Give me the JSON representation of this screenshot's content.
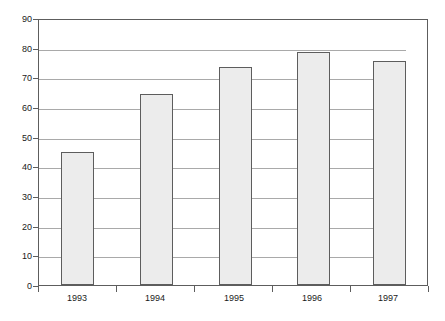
{
  "chart_data": {
    "type": "bar",
    "title": "",
    "subtitle": "",
    "xlabel": "",
    "ylabel": "",
    "categories": [
      "1993",
      "1994",
      "1995",
      "1996",
      "1997"
    ],
    "values": [
      45,
      65,
      74,
      79,
      76
    ],
    "series": [
      {
        "name": "",
        "values": [
          45,
          65,
          74,
          79,
          76
        ]
      }
    ],
    "ylim": [
      0,
      90
    ],
    "ytick_labels": [
      "0",
      "10",
      "20",
      "30",
      "40",
      "50",
      "60",
      "70",
      "80",
      "90"
    ],
    "ytick_values": [
      0,
      10,
      20,
      30,
      40,
      50,
      60,
      70,
      80,
      90
    ],
    "ytick_step": 10,
    "grid": true,
    "grid_axis": "y",
    "legend": false,
    "legend_position": "none",
    "annotations": [],
    "colors": {
      "bar_fill": "#ececec",
      "bar_border": "#5d5d5d",
      "gridline": "#a9a9a9",
      "axis": "#5d5d5d",
      "text": "#1a1a1a",
      "background": "#ffffff"
    }
  }
}
